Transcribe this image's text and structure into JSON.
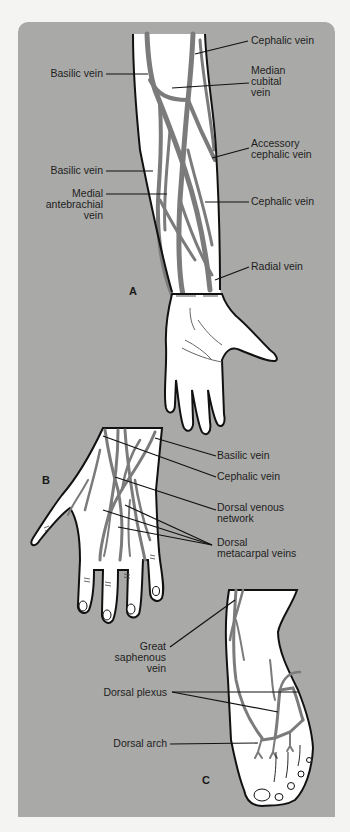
{
  "figure": {
    "panels": [
      {
        "id": "A",
        "label": "A",
        "subject": "forearm-and-hand-palmar",
        "labels": [
          {
            "text": "Cephalic vein"
          },
          {
            "text": "Basilic vein"
          },
          {
            "text": "Median\ncubital\nvein"
          },
          {
            "text": "Accessory\ncephalic vein"
          },
          {
            "text": "Basilic vein"
          },
          {
            "text": "Medial\nantebrachial\nvein"
          },
          {
            "text": "Cephalic vein"
          },
          {
            "text": "Radial vein"
          }
        ]
      },
      {
        "id": "B",
        "label": "B",
        "subject": "hand-dorsal",
        "labels": [
          {
            "text": "Basilic vein"
          },
          {
            "text": "Cephalic vein"
          },
          {
            "text": "Dorsal venous\nnetwork"
          },
          {
            "text": "Dorsal\nmetacarpal veins"
          }
        ]
      },
      {
        "id": "C",
        "label": "C",
        "subject": "foot-dorsal",
        "labels": [
          {
            "text": "Great\nsaphenous\nvein"
          },
          {
            "text": "Dorsal plexus"
          },
          {
            "text": "Dorsal arch"
          }
        ]
      }
    ],
    "colors": {
      "page_background": "#f4f4f2",
      "panel_background": "#a9a9a7",
      "skin": "#ffffff",
      "vein": "#7b7b7b",
      "outline": "#111111"
    }
  }
}
